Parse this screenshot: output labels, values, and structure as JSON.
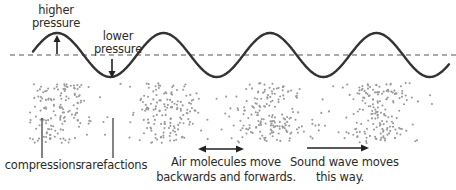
{
  "diagram": {
    "type": "sound-wave-longitudinal",
    "wave": {
      "centerline_y": 55,
      "amplitude": 22,
      "wavelength": 106.5,
      "x_start": 33,
      "x_end": 449,
      "stroke_color": "#333333",
      "centerline_color": "#555555"
    },
    "particles": {
      "color": "#9a9a9a",
      "x_start": 30,
      "x_end": 438,
      "y_start": 83,
      "y_end": 143
    },
    "labels": {
      "higher_pressure_line1": "higher",
      "higher_pressure_line2": "pressure",
      "lower_pressure_line1": "lower",
      "lower_pressure_line2": "pressure",
      "compressions": "compressions",
      "rarefactions": "rarefactions",
      "air_molecules_line1": "Air molecules move",
      "air_molecules_line2": "backwards and forwards.",
      "sound_wave_line1": "Sound wave moves",
      "sound_wave_line2": "this way."
    },
    "arrows": [
      {
        "name": "higher-pressure-arrow",
        "direction": "up"
      },
      {
        "name": "lower-pressure-arrow",
        "direction": "down"
      },
      {
        "name": "oscillation-arrow",
        "direction": "both-horizontal"
      },
      {
        "name": "propagation-arrow",
        "direction": "right"
      }
    ]
  }
}
